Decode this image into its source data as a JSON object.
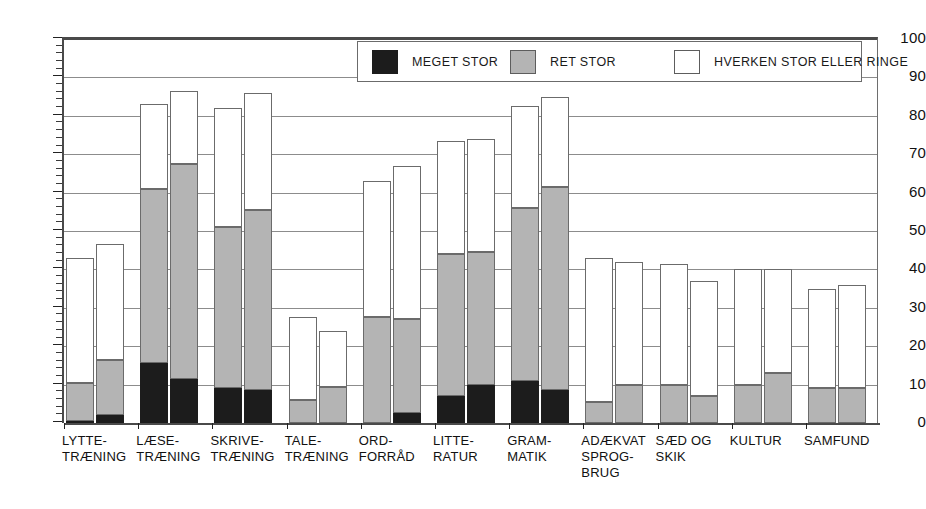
{
  "chart_data": {
    "type": "bar",
    "title": "",
    "subtitle": "",
    "xlabel": "",
    "ylabel": "",
    "ylim": [
      0,
      100
    ],
    "ytick_step": 10,
    "yticks": [
      0,
      10,
      20,
      30,
      40,
      50,
      60,
      70,
      80,
      90,
      100
    ],
    "minor_tick_step": 2,
    "grid": "horizontal",
    "stacked": true,
    "grouped": true,
    "group_size": 2,
    "legend_position": "top-center",
    "legend": [
      "MEGET STOR",
      "RET STOR",
      "HVERKEN STOR ELLER RINGE"
    ],
    "categories": [
      "LYTTE-\nTRÆNING",
      "LÆSE-\nTRÆNING",
      "SKRIVE-\nTRÆNING",
      "TALE-\nTRÆNING",
      "ORD-\nFORRÅD",
      "LITTE-\nRATUR",
      "GRAM-\nMATIK",
      "ADÆKVAT\nSPROG-\nBRUG",
      "SÆD OG\nSKIK",
      "KULTUR",
      "SAMFUND"
    ],
    "series": [
      {
        "name": "MEGET STOR",
        "color": "#1c1c1c",
        "bar_a": [
          0.5,
          15.5,
          9,
          0,
          0,
          7,
          11,
          0,
          0,
          0,
          0
        ],
        "bar_b": [
          2,
          11.5,
          8.5,
          0,
          2.5,
          10,
          8.5,
          0,
          0,
          0,
          0
        ]
      },
      {
        "name": "RET STOR",
        "color": "#b4b4b4",
        "bar_a": [
          10,
          45.5,
          42,
          6,
          27.5,
          37,
          45,
          5.5,
          10,
          10,
          9
        ],
        "bar_b": [
          14.5,
          56,
          47,
          9.5,
          24.5,
          34.5,
          53,
          10,
          7,
          13,
          9
        ]
      },
      {
        "name": "HVERKEN STOR ELLER RINGE",
        "color": "#ffffff",
        "bar_a": [
          32.5,
          22,
          31,
          21.5,
          35.5,
          29.5,
          26.5,
          37.5,
          31.5,
          30,
          26
        ],
        "bar_b": [
          30,
          19,
          30.5,
          14.5,
          40,
          29.5,
          23.5,
          32,
          30,
          27,
          27
        ]
      }
    ],
    "totals": {
      "bar_a": [
        43,
        83,
        82,
        27.5,
        63,
        73.5,
        82.5,
        43,
        41.5,
        40,
        35
      ],
      "bar_b": [
        46.5,
        86.5,
        86,
        24,
        67,
        74,
        85,
        42,
        37,
        40,
        36
      ]
    }
  },
  "axis": {
    "ytick_labels": [
      "100",
      "90",
      "80",
      "70",
      "60",
      "50",
      "40",
      "30",
      "20",
      "10",
      "0"
    ]
  },
  "legend": {
    "items": [
      {
        "label": "MEGET STOR",
        "swatch": "black-swatch"
      },
      {
        "label": "RET STOR",
        "swatch": "grey-swatch"
      },
      {
        "label": "HVERKEN STOR ELLER RINGE",
        "swatch": "white-swatch"
      }
    ]
  }
}
